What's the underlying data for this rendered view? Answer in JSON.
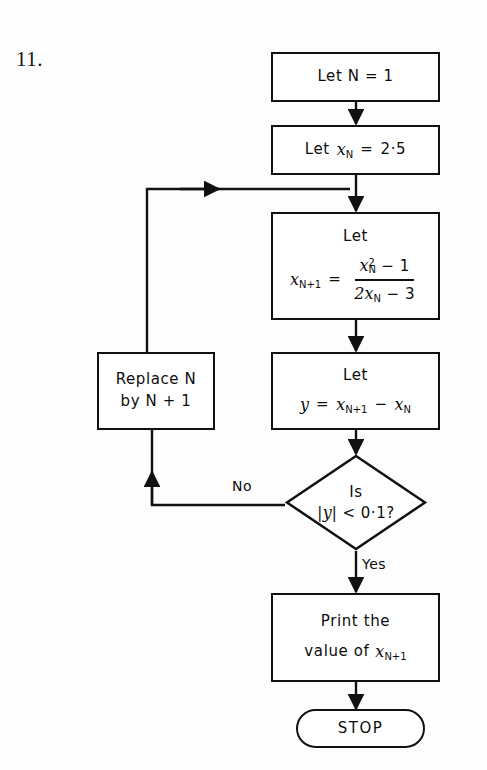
{
  "figure": {
    "question_number": "11.",
    "type": "flowchart"
  },
  "nodes": {
    "init_n": {
      "shape": "rectangle",
      "text": "Let  N = 1"
    },
    "init_x": {
      "shape": "rectangle",
      "line1_let": "Let",
      "var": "x",
      "sub": "N",
      "equals": "=",
      "value": "2·5"
    },
    "iterate": {
      "shape": "rectangle",
      "line1": "Let",
      "lhs_var": "x",
      "lhs_sub": "N+1",
      "equals": "=",
      "numerator_var": "x",
      "numerator_sub": "N",
      "numerator_sup": "2",
      "numerator_rest": "− 1",
      "denominator": "2x",
      "denominator_sub": "N",
      "denominator_rest": "− 3"
    },
    "difference": {
      "shape": "rectangle",
      "line1": "Let",
      "lhs": "y",
      "equals": "=",
      "term1_var": "x",
      "term1_sub": "N+1",
      "minus": "−",
      "term2_var": "x",
      "term2_sub": "N"
    },
    "decision": {
      "shape": "diamond",
      "line1": "Is",
      "abs_open": "|",
      "abs_var": "y",
      "abs_close": "|",
      "comparator": "<",
      "threshold": "0·1?"
    },
    "replace": {
      "shape": "rectangle",
      "line1": "Replace  N",
      "line2": "by  N + 1"
    },
    "print": {
      "shape": "rectangle",
      "line1": "Print  the",
      "line2_prefix": "value  of",
      "line2_var": "x",
      "line2_sub": "N+1"
    },
    "stop": {
      "shape": "capsule",
      "text": "STOP"
    }
  },
  "edge_labels": {
    "no": "No",
    "yes": "Yes"
  },
  "colors": {
    "stroke": "#111111",
    "background": "#ffffff",
    "text": "#0d0d0d"
  }
}
